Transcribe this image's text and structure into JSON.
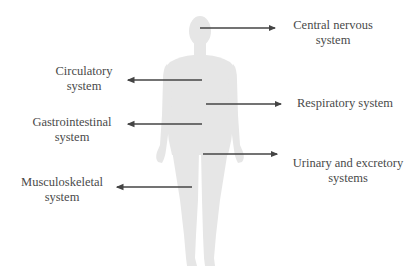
{
  "diagram": {
    "type": "human-body-systems",
    "figure": "human-silhouette",
    "colors": {
      "silhouette": "#e6e6e6",
      "arrow": "#444444",
      "text": "#4a4a4a"
    },
    "labels": {
      "cns": {
        "line1": "Central nervous",
        "line2": "system",
        "side": "right"
      },
      "circulatory": {
        "line1": "Circulatory",
        "line2": "system",
        "side": "left"
      },
      "respiratory": {
        "line1": "Respiratory system",
        "side": "right"
      },
      "gastrointestinal": {
        "line1": "Gastrointestinal",
        "line2": "system",
        "side": "left"
      },
      "urinary": {
        "line1": "Urinary and excretory",
        "line2": "systems",
        "side": "right"
      },
      "musculoskeletal": {
        "line1": "Musculoskeletal",
        "line2": "system",
        "side": "left"
      }
    }
  }
}
